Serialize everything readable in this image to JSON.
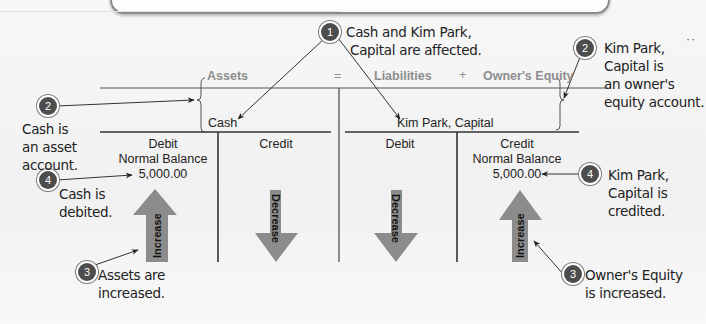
{
  "equation": {
    "assets": "Assets",
    "equals": "=",
    "liabilities": "Liabilities",
    "plus": "+",
    "owners_equity": "Owner's Equity"
  },
  "accounts": {
    "left": {
      "name": "Cash",
      "debit_header": "Debit",
      "debit_sub": "Normal Balance",
      "debit_value": "5,000.00",
      "credit_header": "Credit",
      "debit_arrow": "Increase",
      "credit_arrow": "Decrease"
    },
    "right": {
      "name": "Kim Park, Capital",
      "debit_header": "Debit",
      "credit_header": "Credit",
      "credit_sub": "Normal Balance",
      "credit_value": "5,000.00",
      "debit_arrow": "Decrease",
      "credit_arrow": "Increase"
    }
  },
  "callouts": [
    {
      "num": "1",
      "text_line1": "Cash and Kim Park,",
      "text_line2": "Capital are affected."
    },
    {
      "num": "2",
      "text_line1": "Cash is",
      "text_line2": "an asset",
      "text_line3": "account."
    },
    {
      "num": "2",
      "text_line1": "Kim Park,",
      "text_line2": "Capital is",
      "text_line3": "an owner's",
      "text_line4": "equity account."
    },
    {
      "num": "4",
      "text_line1": "Cash is",
      "text_line2": "debited."
    },
    {
      "num": "4",
      "text_line1": "Kim Park,",
      "text_line2": "Capital is",
      "text_line3": "credited."
    },
    {
      "num": "3",
      "text_line1": "Assets are",
      "text_line2": "increased."
    },
    {
      "num": "3",
      "text_line1": "Owner's Equity",
      "text_line2": "is increased."
    }
  ],
  "colors": {
    "arrow_fill": "#8c8c8c",
    "badge_fill": "#4d4d4d",
    "header_gray": "#8e8e8e"
  },
  "decor": {
    "dots": "··"
  }
}
